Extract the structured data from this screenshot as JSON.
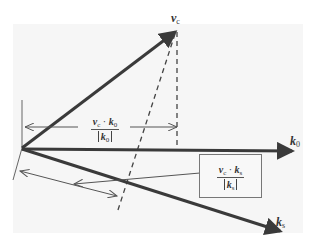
{
  "diagram": {
    "vectors": {
      "vc": {
        "label": "v",
        "sub": "c"
      },
      "k0": {
        "label": "k",
        "sub": "0"
      },
      "ks": {
        "label": "k",
        "sub": "s"
      }
    },
    "projection_k0": {
      "num_v": "v",
      "num_v_sub": "c",
      "dot": " · ",
      "num_k": "k",
      "num_k_sub": "0",
      "den_k": "k",
      "den_k_sub": "0"
    },
    "projection_ks": {
      "num_v": "v",
      "num_v_sub": "c",
      "dot": " · ",
      "num_k": "k",
      "num_k_sub": "s",
      "den_k": "k",
      "den_k_sub": "s"
    },
    "colors": {
      "vector": "#3a3a3a",
      "line": "#555555",
      "background": "#f6f6f6"
    }
  }
}
